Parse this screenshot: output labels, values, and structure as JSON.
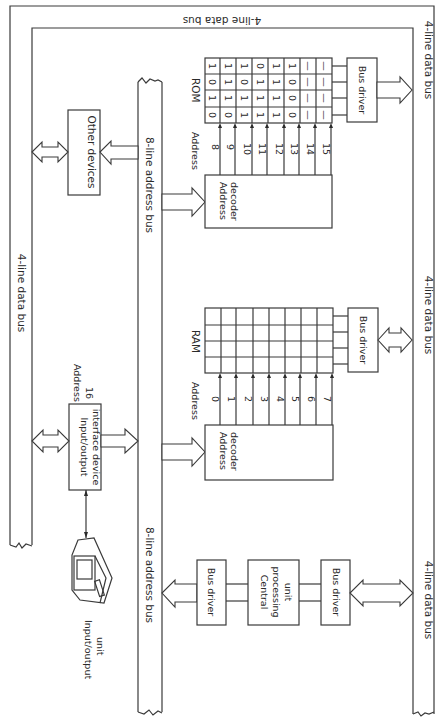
{
  "figure": {
    "orientation": "rotated 90 degrees clockwise",
    "buses": {
      "data_bus_top": "4-line data bus",
      "data_bus_left": "4-line data bus",
      "data_bus_right_upper": "4-line data bus",
      "data_bus_right_middle": "4-line data bus",
      "data_bus_right_lower": "4-line data bus",
      "address_bus_upper": "8-line address bus",
      "address_bus_lower": "8-line address bus"
    },
    "other_devices": {
      "label": "Other devices"
    },
    "rom": {
      "title": "ROM",
      "address_label": "Address",
      "decoder_line1": "Address",
      "decoder_line2": "decoder",
      "bus_driver": "Bus driver",
      "addresses": [
        "8",
        "9",
        "10",
        "11",
        "12",
        "13",
        "14",
        "15"
      ],
      "contents": [
        [
          "0",
          "1",
          "0",
          "1"
        ],
        [
          "0",
          "1",
          "1",
          "1"
        ],
        [
          "1",
          "1",
          "0",
          "1"
        ],
        [
          "1",
          "1",
          "1",
          "0"
        ],
        [
          "1",
          "1",
          "1",
          "1"
        ],
        [
          "0",
          "0",
          "0",
          "1"
        ],
        [
          "—",
          "—",
          "—",
          "—"
        ],
        [
          "—",
          "—",
          "—",
          "—"
        ]
      ]
    },
    "ram": {
      "title": "RAM",
      "address_label": "Address",
      "decoder_line1": "Address",
      "decoder_line2": "decoder",
      "bus_driver": "Bus driver",
      "addresses": [
        "0",
        "1",
        "2",
        "3",
        "4",
        "5",
        "6",
        "7"
      ]
    },
    "io_interface": {
      "line1": "Input/output",
      "line2": "interface device",
      "address_label": "Address",
      "address_value": "16"
    },
    "io_unit": {
      "line1": "Input/output",
      "line2": "unit"
    },
    "cpu": {
      "line1": "Central",
      "line2": "processing",
      "line3": "unit",
      "bus_driver_address": "Bus driver",
      "bus_driver_data": "Bus driver"
    }
  }
}
